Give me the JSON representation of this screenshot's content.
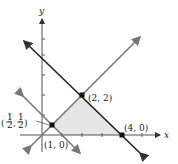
{
  "axes": {
    "x_label": "x",
    "y_label": "y"
  },
  "points": [
    {
      "label": "(2, 2)"
    },
    {
      "label": "(4, 0)"
    },
    {
      "label": "(1, 0)"
    },
    {
      "label_num": "1",
      "label_den": "2"
    }
  ],
  "colors": {
    "shade": "#e6e6e6",
    "line_dark": "#222222",
    "line_gray": "#777777"
  }
}
